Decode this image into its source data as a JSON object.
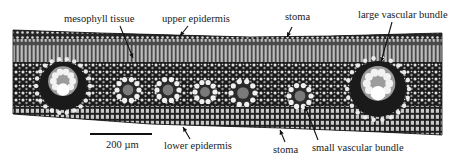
{
  "figure": {
    "type": "leaf cross-section micrograph",
    "width": 453,
    "height": 158,
    "background": "#ffffff",
    "ink": "#111111",
    "section": {
      "top_edge": [
        [
          13,
          30
        ],
        [
          100,
          33
        ],
        [
          250,
          37
        ],
        [
          330,
          36
        ],
        [
          442,
          33
        ]
      ],
      "bottom_edge": [
        [
          442,
          135
        ],
        [
          380,
          132
        ],
        [
          280,
          128
        ],
        [
          150,
          124
        ],
        [
          13,
          114
        ]
      ]
    },
    "vascular_bundles": {
      "large": [
        {
          "cx": 63,
          "cy": 86,
          "r": 24
        },
        {
          "cx": 378,
          "cy": 89,
          "r": 28
        }
      ],
      "small": [
        {
          "cx": 128,
          "cy": 90,
          "r": 12
        },
        {
          "cx": 168,
          "cy": 90,
          "r": 12
        },
        {
          "cx": 205,
          "cy": 92,
          "r": 11
        },
        {
          "cx": 243,
          "cy": 93,
          "r": 13
        },
        {
          "cx": 300,
          "cy": 96,
          "r": 12
        }
      ]
    }
  },
  "labels": {
    "mesophyll_tissue": {
      "text": "mesophyll tissue",
      "x": 64,
      "y": 13
    },
    "upper_epidermis": {
      "text": "upper epidermis",
      "x": 162,
      "y": 13
    },
    "stoma_top": {
      "text": "stoma",
      "x": 285,
      "y": 11
    },
    "large_vascular_bundle": {
      "text": "large vascular bundle",
      "x": 358,
      "y": 9
    },
    "lower_epidermis": {
      "text": "lower epidermis",
      "x": 164,
      "y": 140
    },
    "stoma_bottom": {
      "text": "stoma",
      "x": 273,
      "y": 144
    },
    "small_vascular_bundle": {
      "text": "small vascular bundle",
      "x": 312,
      "y": 142
    }
  },
  "scale_bar": {
    "text": "200 µm",
    "x": 90,
    "y": 133,
    "length": 62,
    "label_x": 106,
    "label_y": 139
  },
  "pointers": [
    {
      "name": "mesophyll-arrow",
      "from": [
        120,
        26
      ],
      "to": [
        133,
        58
      ]
    },
    {
      "name": "upper-epidermis-arrow",
      "from": [
        188,
        26
      ],
      "to": [
        180,
        36
      ]
    },
    {
      "name": "stoma-top-arrow",
      "from": [
        292,
        27
      ],
      "to": [
        287,
        37
      ]
    },
    {
      "name": "large-bundle-arrow",
      "from": [
        392,
        22
      ],
      "to": [
        381,
        62
      ]
    },
    {
      "name": "lower-epidermis-arrow",
      "from": [
        190,
        139
      ],
      "to": [
        183,
        127
      ]
    },
    {
      "name": "stoma-bottom-arrow",
      "from": [
        285,
        142
      ],
      "to": [
        280,
        130
      ]
    },
    {
      "name": "small-bundle-arrow",
      "from": [
        318,
        140
      ],
      "to": [
        305,
        106
      ]
    }
  ]
}
